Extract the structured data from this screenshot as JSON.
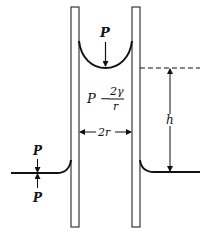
{
  "diagram": {
    "labels": {
      "pressure_above_meniscus": "P",
      "pressure_below_meniscus_P": "P",
      "pressure_below_meniscus_minus": "−",
      "pressure_below_meniscus_num": "2γ",
      "pressure_below_meniscus_den": "r",
      "tube_diameter": "2r",
      "rise_height": "h",
      "outer_pressure_top": "P",
      "outer_pressure_bottom": "P"
    },
    "colors": {
      "stroke": "#111111",
      "background": "#ffffff"
    }
  }
}
